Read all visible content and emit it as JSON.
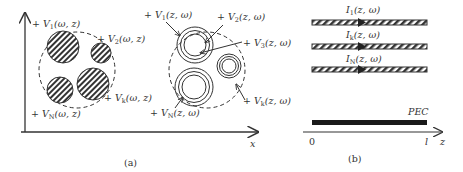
{
  "figure": {
    "panel_a": {
      "caption": "(a)",
      "x_axis_label": "x",
      "left_group": {
        "description": "hatched solid conductors inside dashed boundary",
        "labels": {
          "v1": {
            "prefix": "+ V",
            "sub": "1",
            "args": "(ω, z)"
          },
          "v2": {
            "prefix": "+ V",
            "sub": "2",
            "args": "(ω, z)"
          },
          "vk": {
            "prefix": "+ V",
            "sub": "k",
            "args": "(ω, z)"
          },
          "vN": {
            "prefix": "+ V",
            "sub": "N",
            "args": "(ω, z)"
          }
        }
      },
      "right_group": {
        "description": "concentric-ring (shielded) conductors inside dashed boundary",
        "labels": {
          "v1": {
            "prefix": "+ V",
            "sub": "1",
            "args": "(z, ω)"
          },
          "v2": {
            "prefix": "+ V",
            "sub": "2",
            "args": "(z, ω)"
          },
          "v3": {
            "prefix": "+ V",
            "sub": "3",
            "args": "(z, ω)"
          },
          "vk": {
            "prefix": "+ V",
            "sub": "k",
            "args": "(z, ω)"
          },
          "vN": {
            "prefix": "+ V",
            "sub": "N",
            "args": "(z, ω)"
          }
        }
      }
    },
    "panel_b": {
      "caption": "(b)",
      "z_axis_label": "z",
      "origin_label": "0",
      "length_label": "l",
      "ground_label": "PEC",
      "currents": [
        {
          "prefix": "I",
          "sub": "1",
          "args": "(z, ω)"
        },
        {
          "prefix": "I",
          "sub": "k",
          "args": "(z, ω)"
        },
        {
          "prefix": "I",
          "sub": "N",
          "args": "(z, ω)"
        }
      ]
    }
  },
  "colors": {
    "ink": "#333333",
    "background": "#ffffff"
  }
}
